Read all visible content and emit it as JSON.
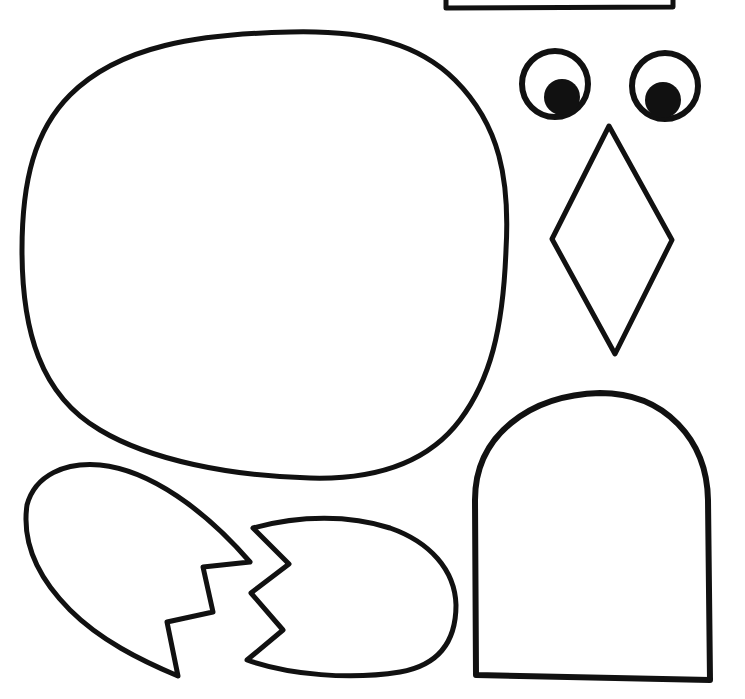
{
  "page": {
    "background": "#ffffff",
    "stroke_color": "#111111",
    "fill_color": "#ffffff"
  },
  "shapes": [
    {
      "id": "top-rectangle",
      "label": "Partial rectangle (cut off at top)"
    },
    {
      "id": "body",
      "label": "Rounded body"
    },
    {
      "id": "eye-left",
      "label": "Left googly eye"
    },
    {
      "id": "eye-right",
      "label": "Right googly eye"
    },
    {
      "id": "beak",
      "label": "Diamond beak"
    },
    {
      "id": "egg-shell-left",
      "label": "Left egg shell half"
    },
    {
      "id": "egg-shell-right",
      "label": "Right egg shell half"
    },
    {
      "id": "arch-piece",
      "label": "Arch-shaped piece"
    }
  ]
}
